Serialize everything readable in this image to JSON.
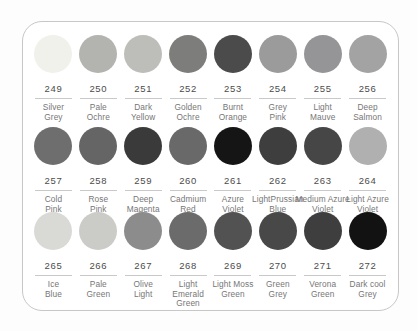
{
  "style": {
    "card_background": "#ffffff",
    "card_border": "#c7c7c7",
    "number_color": "#4c4c4c",
    "name_color": "#767676",
    "divider_color": "#c9c9c9"
  },
  "palette": {
    "swatches": [
      {
        "number": "249",
        "name": "Silver Grey",
        "name_lines": [
          "Silver",
          "Grey"
        ],
        "color": "#f1f1eb"
      },
      {
        "number": "250",
        "name": "Pale Ochre",
        "name_lines": [
          "Pale",
          "Ochre"
        ],
        "color": "#b3b3b0"
      },
      {
        "number": "251",
        "name": "Dark Yellow",
        "name_lines": [
          "Dark",
          "Yellow"
        ],
        "color": "#bdbdba"
      },
      {
        "number": "252",
        "name": "Golden Ochre",
        "name_lines": [
          "Golden",
          "Ochre"
        ],
        "color": "#7d7d7b"
      },
      {
        "number": "253",
        "name": "Burnt Orange",
        "name_lines": [
          "Burnt",
          "Orange"
        ],
        "color": "#4b4b4b"
      },
      {
        "number": "254",
        "name": "Grey Pink",
        "name_lines": [
          "Grey",
          "Pink"
        ],
        "color": "#9b9b9b"
      },
      {
        "number": "255",
        "name": "Light Mauve",
        "name_lines": [
          "Light",
          "Mauve"
        ],
        "color": "#959598"
      },
      {
        "number": "256",
        "name": "Deep Salmon",
        "name_lines": [
          "Deep",
          "Salmon"
        ],
        "color": "#a3a3a3"
      },
      {
        "number": "257",
        "name": "Cold Pink",
        "name_lines": [
          "Cold",
          "Pink"
        ],
        "color": "#6e6e6e"
      },
      {
        "number": "258",
        "name": "Rose Pink",
        "name_lines": [
          "Rose",
          "Pink"
        ],
        "color": "#656565"
      },
      {
        "number": "259",
        "name": "Deep Magenta",
        "name_lines": [
          "Deep",
          "Magenta"
        ],
        "color": "#3a3a3a"
      },
      {
        "number": "260",
        "name": "Cadmium Red",
        "name_lines": [
          "Cadmium",
          "Red"
        ],
        "color": "#696969"
      },
      {
        "number": "261",
        "name": "Azure Violet",
        "name_lines": [
          "Azure",
          "Violet"
        ],
        "color": "#151515"
      },
      {
        "number": "262",
        "name": "Light Prussian Blue",
        "name_lines": [
          "LightPrussian",
          "Blue"
        ],
        "color": "#3e3e3e"
      },
      {
        "number": "263",
        "name": "Medium Azure Violet",
        "name_lines": [
          "Medium Azure",
          "Violet"
        ],
        "color": "#464646"
      },
      {
        "number": "264",
        "name": "Light Azure Violet",
        "name_lines": [
          "Light Azure",
          "Violet"
        ],
        "color": "#b0b0b0"
      },
      {
        "number": "265",
        "name": "Ice Blue",
        "name_lines": [
          "Ice",
          "Blue"
        ],
        "color": "#d9d9d6"
      },
      {
        "number": "266",
        "name": "Pale Green",
        "name_lines": [
          "Pale",
          "Green"
        ],
        "color": "#cbcbc8"
      },
      {
        "number": "267",
        "name": "Olive Light",
        "name_lines": [
          "Olive",
          "Light"
        ],
        "color": "#8c8c8c"
      },
      {
        "number": "268",
        "name": "Light Emerald Green",
        "name_lines": [
          "Light",
          "Emerald",
          "Green"
        ],
        "color": "#6b6b6b"
      },
      {
        "number": "269",
        "name": "Light Moss Green",
        "name_lines": [
          "Light Moss",
          "Green"
        ],
        "color": "#525252"
      },
      {
        "number": "270",
        "name": "Green Grey",
        "name_lines": [
          "Green",
          "Grey"
        ],
        "color": "#484848"
      },
      {
        "number": "271",
        "name": "Verona Green",
        "name_lines": [
          "Verona",
          "Green"
        ],
        "color": "#3e3e3e"
      },
      {
        "number": "272",
        "name": "Dark cool Grey",
        "name_lines": [
          "Dark cool",
          "Grey"
        ],
        "color": "#121212"
      }
    ]
  }
}
